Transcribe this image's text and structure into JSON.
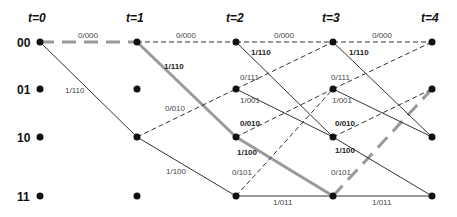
{
  "time_labels": [
    "t=0",
    "t=1",
    "t=2",
    "t=3",
    "t=4"
  ],
  "state_labels": [
    "00",
    "01",
    "10",
    "11"
  ],
  "edge_labels": {
    "t0_00_00": "0/000",
    "t0_00_10": "1/110",
    "t1_00_00": "0/000",
    "t1_00_10": "1/110",
    "t1_10_01": "0/010",
    "t1_10_11": "1/100",
    "t2_00_00": "0/000",
    "t2_00_10": "1/110",
    "t2_01_00": "0/111",
    "t2_01_10": "1/001",
    "t2_10_01": "0/010",
    "t2_10_11": "1/100",
    "t2_11_01": "0/101",
    "t2_11_11": "1/011",
    "t3_00_00": "0/000",
    "t3_00_10": "1/110",
    "t3_01_00": "0/111",
    "t3_01_10": "1/001",
    "t3_10_01": "0/010",
    "t3_10_11": "1/100",
    "t3_11_01": "0/101",
    "t3_11_11": "1/011"
  },
  "legend": {
    "solid_line": "input 1",
    "dashed_line": "input 0",
    "highlighted_path": "00 → 00 → 10 → 11 → 01"
  },
  "colors": {
    "edge": "#333333",
    "highlight": "#999999",
    "node": "#111111"
  }
}
